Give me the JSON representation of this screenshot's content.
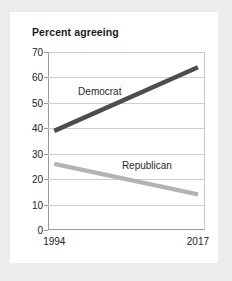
{
  "card": {
    "background": "#ffffff",
    "page_background": "#ececec"
  },
  "chart_data": {
    "type": "line",
    "title": "Percent agreeing",
    "xlabel": "",
    "ylabel": "",
    "x": [
      "1994",
      "2017"
    ],
    "xtick_labels": [
      "1994",
      "2017"
    ],
    "ytick_labels": [
      "0",
      "10",
      "20",
      "30",
      "40",
      "50",
      "60",
      "70"
    ],
    "yticks": [
      0,
      10,
      20,
      30,
      40,
      50,
      60,
      70
    ],
    "ylim": [
      0,
      70
    ],
    "grid": "horizontal",
    "legend_position": "inline-annotations",
    "series": [
      {
        "name": "Democrat",
        "values": [
          39,
          64
        ],
        "color": "#4d4d4d",
        "label_x_frac": 0.33,
        "label_y_value": 54.5
      },
      {
        "name": "Republican",
        "values": [
          26,
          14
        ],
        "color": "#b3b3b3",
        "label_x_frac": 0.63,
        "label_y_value": 25.5
      }
    ],
    "annotations": [
      "Democrat",
      "Republican"
    ]
  }
}
